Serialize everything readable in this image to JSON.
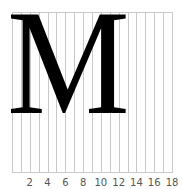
{
  "glyph": {
    "character": "M",
    "color": "#000000"
  },
  "grid": {
    "columns": 18,
    "line_color": "#c8c8c8"
  },
  "axis": {
    "tick_labels": [
      "2",
      "4",
      "6",
      "8",
      "10",
      "12",
      "14",
      "16",
      "18"
    ]
  }
}
